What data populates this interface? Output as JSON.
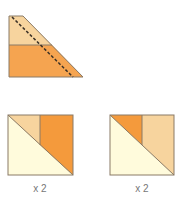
{
  "diagram": {
    "colors": {
      "light_orange": "#f7d49e",
      "orange": "#f5a450",
      "dark_orange": "#f49a3c",
      "cream": "#fffbdc",
      "outline": "#8a7a66",
      "dash": "#3a3026"
    },
    "top_piece": {
      "description": "Trapezoid strip unit with dashed cutting diagonal",
      "upper_color": "light_orange",
      "lower_color": "orange",
      "cut_line": "dashed"
    },
    "blocks": [
      {
        "name": "block-left",
        "triangle_color": "cream",
        "small_piece_color": "light_orange",
        "large_piece_color": "dark_orange",
        "quantity_label": "x 2"
      },
      {
        "name": "block-right",
        "triangle_color": "cream",
        "small_piece_color": "dark_orange",
        "large_piece_color": "light_orange",
        "quantity_label": "x 2"
      }
    ]
  }
}
